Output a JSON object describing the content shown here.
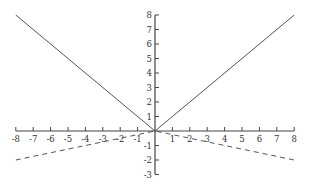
{
  "chart_data": {
    "type": "line",
    "title": "",
    "xlabel": "",
    "ylabel": "",
    "xlim": [
      -8,
      8
    ],
    "ylim": [
      -3,
      8
    ],
    "grid": false,
    "legend": null,
    "x_ticks": [
      -8,
      -7,
      -6,
      -5,
      -4,
      -3,
      -2,
      -1,
      1,
      2,
      3,
      4,
      5,
      6,
      7,
      8
    ],
    "y_ticks": [
      -3,
      -2,
      -1,
      1,
      2,
      3,
      4,
      5,
      6,
      7,
      8
    ],
    "series": [
      {
        "name": "y = |x|",
        "style": "solid",
        "color": "#555555",
        "x": [
          -8,
          0,
          8
        ],
        "y": [
          8,
          0,
          8
        ]
      },
      {
        "name": "y = -|x|/4",
        "style": "dashed",
        "color": "#555555",
        "x": [
          -8,
          0,
          8
        ],
        "y": [
          -2,
          0,
          -2
        ]
      }
    ]
  },
  "layout": {
    "origin_px": [
      155,
      131
    ],
    "x_unit_px": 17.4,
    "y_unit_px": 14.5
  }
}
